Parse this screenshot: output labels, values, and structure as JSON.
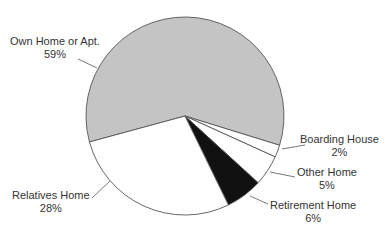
{
  "chart_data": {
    "type": "pie",
    "title": "",
    "categories": [
      "Own Home or Apt.",
      "Boarding House",
      "Other Home",
      "Retirement Home",
      "Relatives Home"
    ],
    "values": [
      59,
      2,
      5,
      6,
      28
    ],
    "unit": "%",
    "colors": [
      "#c4c4c4",
      "#ffffff",
      "#ffffff",
      "#111111",
      "#ffffff"
    ],
    "start_angle_deg": 164.8,
    "direction": "clockwise",
    "legend": "none (direct labels with leader lines)"
  },
  "labels": [
    {
      "name": "Own Home or Apt.",
      "value": "59%"
    },
    {
      "name": "Boarding House",
      "value": "2%"
    },
    {
      "name": "Other Home",
      "value": "5%"
    },
    {
      "name": "Retirement Home",
      "value": "6%"
    },
    {
      "name": "Relatives Home",
      "value": "28%"
    }
  ]
}
